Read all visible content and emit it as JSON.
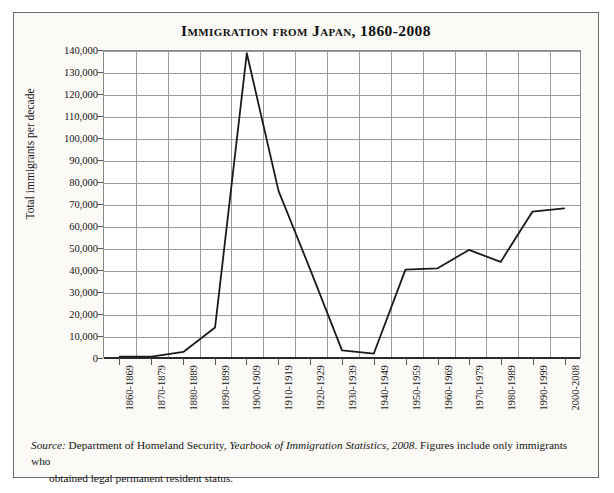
{
  "chart_data": {
    "type": "line",
    "title": "Immigration from Japan, 1860-2008",
    "xlabel": "",
    "ylabel": "Total immigrants per decade",
    "ylim": [
      0,
      140000
    ],
    "grid": true,
    "legend": "none",
    "categories": [
      "1860-1869",
      "1870-1879",
      "1880-1889",
      "1890-1899",
      "1900-1909",
      "1910-1919",
      "1920-1929",
      "1930-1939",
      "1940-1949",
      "1950-1959",
      "1960-1969",
      "1970-1979",
      "1980-1989",
      "1990-1999",
      "2000-2008"
    ],
    "values": [
      200,
      150,
      2300,
      13500,
      139000,
      76000,
      40000,
      3000,
      1500,
      40000,
      40500,
      49000,
      43500,
      66500,
      68000
    ],
    "ytick_labels": [
      "0",
      "10,000",
      "20,000",
      "30,000",
      "40,000",
      "50,000",
      "60,000",
      "70,000",
      "80,000",
      "90,000",
      "100,000",
      "110,000",
      "120,000",
      "130,000",
      "140,000"
    ],
    "ytick_values": [
      0,
      10000,
      20000,
      30000,
      40000,
      50000,
      60000,
      70000,
      80000,
      90000,
      100000,
      110000,
      120000,
      130000,
      140000
    ],
    "line_color": "#1a1a1a",
    "grid_color": "#9b9b9b",
    "plot_background": "#ffffff"
  },
  "source": {
    "label": "Source:",
    "text_before_pub": " Department of Homeland Security, ",
    "publication": "Yearbook of Immigration Statistics, 2008",
    "text_after_pub": ". Figures include only immigrants who",
    "line2": "obtained legal permanent resident status."
  }
}
